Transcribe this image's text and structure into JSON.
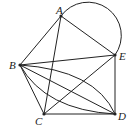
{
  "figure": {
    "points": [
      {
        "name": "A",
        "label": "A"
      },
      {
        "name": "B",
        "label": "B"
      },
      {
        "name": "C",
        "label": "C"
      },
      {
        "name": "D",
        "label": "D"
      },
      {
        "name": "E",
        "label": "E"
      }
    ],
    "segments": [
      "AB",
      "AC",
      "AE",
      "BE",
      "BC",
      "BD",
      "CE",
      "CD",
      "ED"
    ],
    "arcs": [
      "AE",
      "BD-upper",
      "BD-lower"
    ]
  }
}
